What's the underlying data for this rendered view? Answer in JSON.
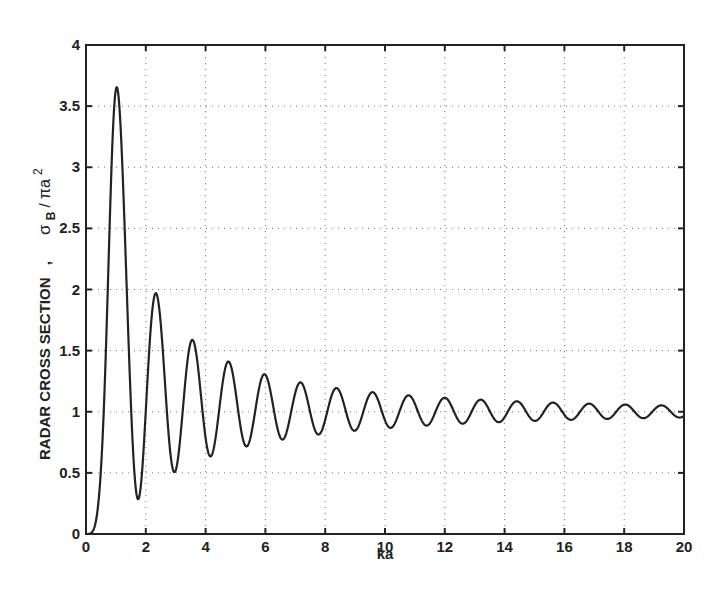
{
  "chart_data": {
    "type": "line",
    "title": "",
    "xlabel": "ka",
    "ylabel": "RADAR CROSS SECTION , σB / πa²",
    "ylabel_parts": {
      "main": "RADAR CROSS SECTION",
      "comma": ",",
      "sigma": "σ",
      "sigma_sub": "B",
      "slash": " / ",
      "pi_a": "πa",
      "sup": "2"
    },
    "xlim": [
      0,
      20
    ],
    "ylim": [
      0,
      4
    ],
    "xticks": [
      0,
      2,
      4,
      6,
      8,
      10,
      12,
      14,
      16,
      18,
      20
    ],
    "xtick_labels": [
      "0",
      "2",
      "4",
      "6",
      "8",
      "10",
      "12",
      "14",
      "16",
      "18",
      "20"
    ],
    "yticks": [
      0,
      0.5,
      1,
      1.5,
      2,
      2.5,
      3,
      3.5,
      4
    ],
    "ytick_labels": [
      "0",
      "0.5",
      "1",
      "1.5",
      "2",
      "2.5",
      "3",
      "3.5",
      "4"
    ],
    "grid": true,
    "legend": null,
    "model": "mie_pec_sphere_monostatic",
    "series": [
      {
        "name": "sigma_B / pi a^2",
        "extrema": [
          {
            "x": 0.0,
            "y": 0.0
          },
          {
            "x": 1.03,
            "y": 3.65
          },
          {
            "x": 1.75,
            "y": 0.28
          },
          {
            "x": 2.38,
            "y": 1.96
          },
          {
            "x": 2.95,
            "y": 0.5
          },
          {
            "x": 3.59,
            "y": 1.58
          },
          {
            "x": 4.15,
            "y": 0.62
          },
          {
            "x": 4.78,
            "y": 1.4
          },
          {
            "x": 5.35,
            "y": 0.7
          },
          {
            "x": 5.98,
            "y": 1.3
          },
          {
            "x": 6.55,
            "y": 0.76
          },
          {
            "x": 7.18,
            "y": 1.23
          },
          {
            "x": 7.75,
            "y": 0.8
          },
          {
            "x": 8.38,
            "y": 1.18
          },
          {
            "x": 8.95,
            "y": 0.83
          },
          {
            "x": 9.58,
            "y": 1.15
          },
          {
            "x": 10.15,
            "y": 0.86
          },
          {
            "x": 10.78,
            "y": 1.12
          },
          {
            "x": 11.35,
            "y": 0.87
          },
          {
            "x": 11.98,
            "y": 1.1
          },
          {
            "x": 12.55,
            "y": 0.89
          },
          {
            "x": 13.18,
            "y": 1.08
          },
          {
            "x": 13.75,
            "y": 0.9
          },
          {
            "x": 14.38,
            "y": 1.07
          },
          {
            "x": 14.95,
            "y": 0.91
          },
          {
            "x": 15.58,
            "y": 1.06
          },
          {
            "x": 16.15,
            "y": 0.92
          },
          {
            "x": 16.78,
            "y": 1.05
          },
          {
            "x": 17.35,
            "y": 0.92
          },
          {
            "x": 17.98,
            "y": 1.04
          },
          {
            "x": 18.55,
            "y": 0.93
          },
          {
            "x": 19.18,
            "y": 1.03
          },
          {
            "x": 20.0,
            "y": 0.93
          }
        ]
      }
    ]
  }
}
